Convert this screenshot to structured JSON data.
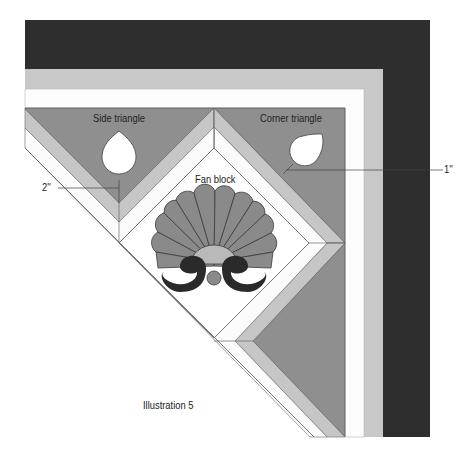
{
  "labels": {
    "side_triangle": "Side triangle",
    "corner_triangle": "Corner triangle",
    "fan_block": "Fan block",
    "measure_side": "2''",
    "measure_corner": "1''",
    "caption": "Illustration 5"
  },
  "colors": {
    "outer_border": "#2e2e2e",
    "middle_border": "#c8c8c8",
    "inner_border": "#ffffff",
    "triangle_fill": "#8f8f8f",
    "strip_light": "#c6c6c6",
    "fan_blade": "#8a8a8a",
    "fan_center": "#b9b9b9",
    "fan_curl": "#2a2a2a"
  }
}
